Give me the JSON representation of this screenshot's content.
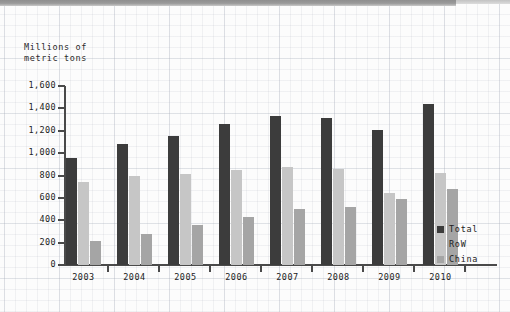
{
  "chart_data": {
    "type": "bar",
    "title": "",
    "ylabel": "Millions of\nmetric tons",
    "ylabel_line1": "Millions of",
    "ylabel_line2": "metric tons",
    "xlabel": "",
    "categories": [
      "2003",
      "2004",
      "2005",
      "2006",
      "2007",
      "2008",
      "2009",
      "2010"
    ],
    "series": [
      {
        "name": "Total",
        "color": "#3c3c3c",
        "values": [
          960,
          1080,
          1150,
          1260,
          1330,
          1310,
          1210,
          1440
        ]
      },
      {
        "name": "RoW",
        "color": "#c6c6c6",
        "values": [
          740,
          795,
          815,
          850,
          880,
          855,
          645,
          820
        ]
      },
      {
        "name": "China",
        "color": "#a5a5a5",
        "values": [
          215,
          280,
          355,
          430,
          500,
          520,
          590,
          680
        ]
      }
    ],
    "ylim": [
      0,
      1600
    ],
    "yticks": [
      "0",
      "200",
      "400",
      "600",
      "800",
      "1,000",
      "1,200",
      "1,400",
      "1,600"
    ],
    "ytick_values": [
      0,
      200,
      400,
      600,
      800,
      1000,
      1200,
      1400,
      1600
    ],
    "grid": true,
    "legend_position": "right-bottom",
    "legend": [
      "Total",
      "RoW",
      "China"
    ]
  },
  "colors": {
    "total": "#3c3c3c",
    "row": "#c6c6c6",
    "china": "#a5a5a5",
    "axis": "#4a4a4a",
    "text": "#222222",
    "background": "#fbfbfb"
  }
}
